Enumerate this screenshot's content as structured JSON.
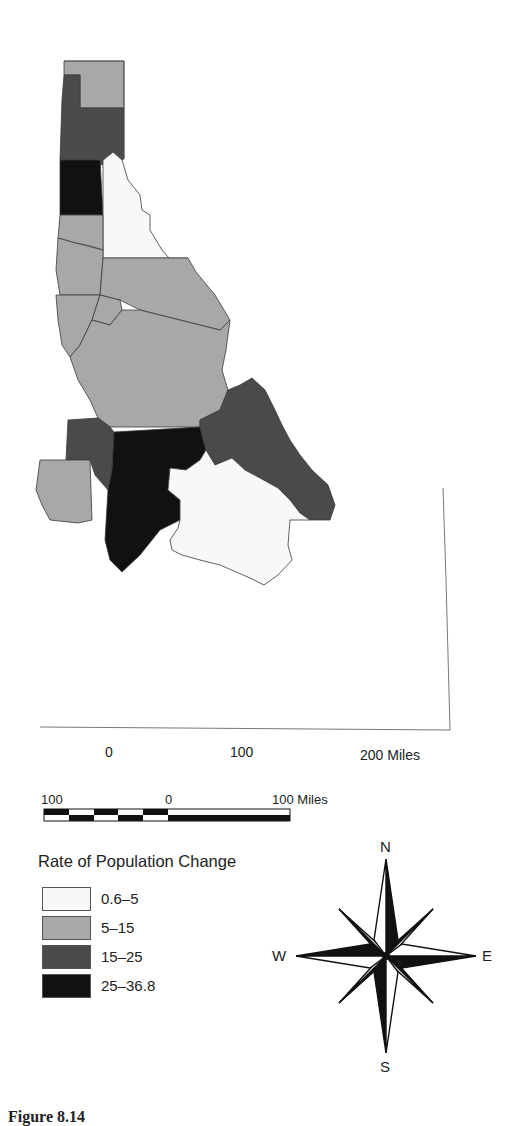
{
  "colors": {
    "class1": "#f8f8f8",
    "class2": "#a8a8a8",
    "class3": "#4a4a4a",
    "class4": "#111111",
    "border": "#3a3a3a"
  },
  "map": {
    "subject": "Idaho counties — rate of population change",
    "top_scale": {
      "ticks": [
        "0",
        "100",
        "200 Miles"
      ]
    },
    "bar_scale": {
      "ticks": [
        "100",
        "0",
        "100 Miles"
      ]
    }
  },
  "legend": {
    "title": "Rate of Population Change",
    "items": [
      {
        "label": "0.6–5",
        "class": "class1"
      },
      {
        "label": "5–15",
        "class": "class2"
      },
      {
        "label": "15–25",
        "class": "class3"
      },
      {
        "label": "25–36.8",
        "class": "class4"
      }
    ]
  },
  "compass": {
    "north": "N",
    "south": "S",
    "east": "E",
    "west": "W"
  },
  "caption": "Figure 8.14"
}
